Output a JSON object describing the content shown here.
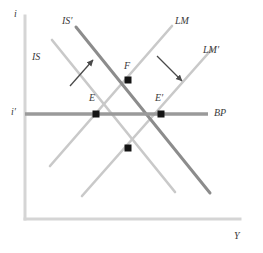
{
  "figure": {
    "type": "is-lm-bp-diagram"
  },
  "axes": {
    "y_axis_label": "i",
    "x_axis_label": "Y",
    "y_tick_label": "i′",
    "axis_color": "#d5d5d5",
    "origin": {
      "x": 25,
      "y": 219
    },
    "y_top": 16,
    "x_right": 240
  },
  "curves": [
    {
      "name": "IS",
      "label": "IS",
      "color": "#c9c9c9",
      "width": 2.6,
      "label_x": 32,
      "label_y": 52,
      "x1": 52,
      "y1": 40,
      "x2": 175,
      "y2": 192
    },
    {
      "name": "IS-prime",
      "label": "IS′",
      "color": "#8c8c8c",
      "width": 3.0,
      "label_x": 62,
      "label_y": 16,
      "x1": 76,
      "y1": 27,
      "x2": 210,
      "y2": 193
    },
    {
      "name": "LM",
      "label": "LM",
      "color": "#c9c9c9",
      "width": 2.6,
      "label_x": 175,
      "label_y": 16,
      "x1": 172,
      "y1": 26,
      "x2": 50,
      "y2": 166
    },
    {
      "name": "LM-prime",
      "label": "LM′",
      "color": "#c9c9c9",
      "width": 2.6,
      "label_x": 203,
      "label_y": 45,
      "x1": 212,
      "y1": 49,
      "x2": 82,
      "y2": 196
    },
    {
      "name": "BP",
      "label": "BP",
      "color": "#9a9a9a",
      "width": 3.4,
      "label_x": 214,
      "label_y": 108,
      "x1": 25,
      "y1": 114,
      "x2": 208,
      "y2": 114
    }
  ],
  "points": [
    {
      "name": "E",
      "label": "E",
      "x": 96,
      "y": 114,
      "label_x": 89,
      "label_y": 93
    },
    {
      "name": "E-prime",
      "label": "E′",
      "x": 161,
      "y": 114,
      "label_x": 155,
      "label_y": 93
    },
    {
      "name": "F",
      "label": "F",
      "x": 128,
      "y": 80,
      "label_x": 124,
      "label_y": 61
    },
    {
      "name": "G",
      "label": "",
      "x": 128,
      "y": 148,
      "label_x": 0,
      "label_y": 0
    }
  ],
  "arrows": [
    {
      "name": "is-shift-arrow",
      "direction": "up-right",
      "color": "#4a4a4a",
      "x1": 70,
      "y1": 86,
      "x2": 94,
      "y2": 59
    },
    {
      "name": "lm-shift-arrow",
      "direction": "down-right",
      "color": "#4a4a4a",
      "x1": 157,
      "y1": 56,
      "x2": 183,
      "y2": 82
    }
  ],
  "colors": {
    "background": "#ffffff",
    "axis": "#d5d5d5",
    "curve_light": "#c9c9c9",
    "curve_dark": "#8c8c8c",
    "bp_line": "#9a9a9a",
    "point": "#141414",
    "text": "#3a3a3a"
  }
}
